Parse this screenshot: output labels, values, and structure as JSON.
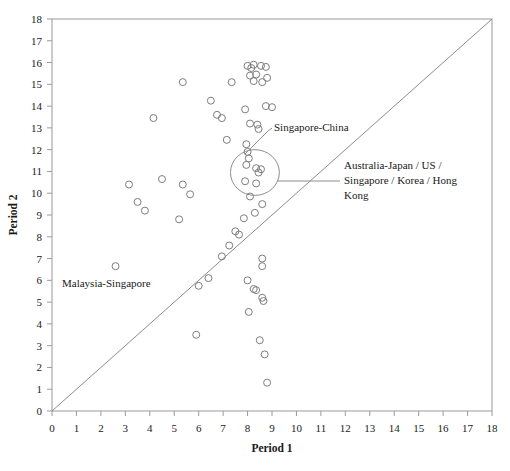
{
  "chart_data": {
    "type": "scatter",
    "title": "",
    "xlabel": "Period 1",
    "ylabel": "Period 2",
    "xlim": [
      0,
      18
    ],
    "ylim": [
      0,
      18
    ],
    "xticks": [
      0,
      1,
      2,
      3,
      4,
      5,
      6,
      7,
      8,
      9,
      10,
      11,
      12,
      13,
      14,
      15,
      16,
      17,
      18
    ],
    "yticks": [
      0,
      1,
      2,
      3,
      4,
      5,
      6,
      7,
      8,
      9,
      10,
      11,
      12,
      13,
      14,
      15,
      16,
      17,
      18
    ],
    "xtick_labels": [
      "0",
      "1",
      "2",
      "3",
      "4",
      "5",
      "6",
      "7",
      "8",
      "9",
      "10",
      "11",
      "12",
      "13",
      "14",
      "15",
      "16",
      "17",
      "18"
    ],
    "ytick_labels": [
      "0",
      "1",
      "2",
      "3",
      "4",
      "5",
      "6",
      "7",
      "8",
      "9",
      "10",
      "11",
      "12",
      "13",
      "14",
      "15",
      "16",
      "17",
      "18"
    ],
    "grid": false,
    "legend": false,
    "marker_style": "open-circle",
    "marker_color": "#7d7d7d",
    "reference_line": {
      "type": "identity",
      "label": "y = x",
      "from": [
        0,
        0
      ],
      "to": [
        18,
        18
      ]
    },
    "points": [
      [
        5.35,
        15.1
      ],
      [
        7.35,
        15.1
      ],
      [
        8.0,
        15.85
      ],
      [
        8.15,
        15.75
      ],
      [
        8.25,
        15.9
      ],
      [
        8.55,
        15.85
      ],
      [
        8.75,
        15.8
      ],
      [
        8.1,
        15.4
      ],
      [
        8.35,
        15.45
      ],
      [
        8.8,
        15.3
      ],
      [
        8.25,
        15.15
      ],
      [
        8.6,
        15.1
      ],
      [
        6.5,
        14.25
      ],
      [
        7.9,
        13.85
      ],
      [
        8.75,
        14.0
      ],
      [
        9.0,
        13.95
      ],
      [
        4.15,
        13.45
      ],
      [
        6.75,
        13.6
      ],
      [
        6.95,
        13.45
      ],
      [
        8.1,
        13.2
      ],
      [
        8.4,
        13.15
      ],
      [
        8.45,
        12.95
      ],
      [
        7.15,
        12.45
      ],
      [
        7.95,
        12.25
      ],
      [
        8.0,
        11.9
      ],
      [
        8.05,
        11.6
      ],
      [
        7.95,
        11.3
      ],
      [
        8.35,
        11.15
      ],
      [
        8.55,
        11.1
      ],
      [
        8.45,
        10.95
      ],
      [
        7.9,
        10.55
      ],
      [
        8.35,
        10.45
      ],
      [
        3.15,
        10.4
      ],
      [
        4.5,
        10.65
      ],
      [
        5.35,
        10.4
      ],
      [
        5.65,
        9.95
      ],
      [
        3.5,
        9.6
      ],
      [
        3.8,
        9.2
      ],
      [
        5.2,
        8.8
      ],
      [
        8.1,
        9.85
      ],
      [
        8.6,
        9.5
      ],
      [
        8.3,
        9.1
      ],
      [
        7.85,
        8.85
      ],
      [
        7.5,
        8.25
      ],
      [
        7.65,
        8.1
      ],
      [
        7.25,
        7.6
      ],
      [
        6.95,
        7.1
      ],
      [
        8.6,
        7.0
      ],
      [
        8.6,
        6.65
      ],
      [
        2.6,
        6.65
      ],
      [
        6.4,
        6.1
      ],
      [
        6.0,
        5.75
      ],
      [
        8.0,
        6.0
      ],
      [
        8.25,
        5.6
      ],
      [
        8.35,
        5.55
      ],
      [
        8.6,
        5.2
      ],
      [
        8.65,
        5.05
      ],
      [
        8.05,
        4.55
      ],
      [
        5.9,
        3.5
      ],
      [
        8.5,
        3.25
      ],
      [
        8.7,
        2.6
      ],
      [
        8.8,
        1.3
      ]
    ],
    "highlight_region": {
      "shape": "ellipse",
      "center_x": 8.3,
      "center_y": 10.95,
      "radius_x": 1.0,
      "radius_y": 1.05
    },
    "annotations": [
      {
        "id": "singapore-china",
        "text": "Singapore-China",
        "point": [
          8.0,
          11.9
        ]
      },
      {
        "id": "australia-japan-group",
        "text": "Australia-Japan / US / Singapore / Korea / Hong Kong",
        "lines": [
          "Australia-Japan / US /",
          "Singapore / Korea / Hong",
          "Kong"
        ],
        "point": [
          8.3,
          10.95
        ]
      },
      {
        "id": "malaysia-singapore",
        "text": "Malaysia-Singapore",
        "point": [
          2.6,
          6.65
        ]
      }
    ]
  }
}
